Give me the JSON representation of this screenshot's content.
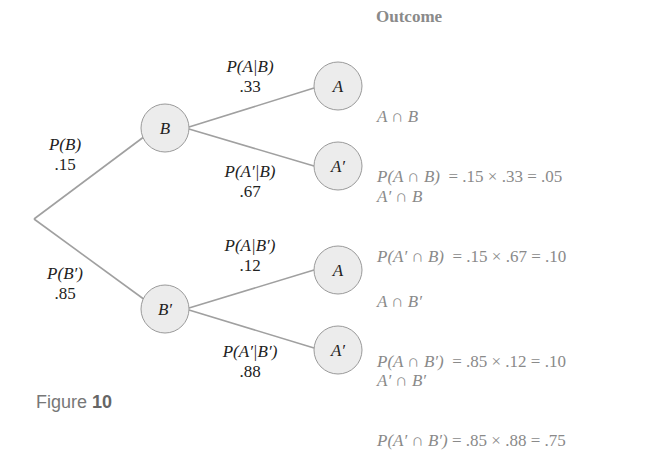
{
  "figure": {
    "label": "Figure",
    "number": "10"
  },
  "header": {
    "outcome": "Outcome"
  },
  "colors": {
    "line": "#a0a0a0",
    "node_fill": "#ececec",
    "node_stroke": "#9a9a9a",
    "label_text": "#222222",
    "outcome_text": "#8a8a8a"
  },
  "nodes": {
    "B": "B",
    "Bp": "B′",
    "A_top": "A",
    "Ap_top": "A′",
    "A_bot": "A",
    "Ap_bot": "A′"
  },
  "branches": {
    "B": {
      "prob_label": "P(B)",
      "value": ".15"
    },
    "Bp": {
      "prob_label": "P(B′)",
      "value": ".85"
    },
    "A_given_B": {
      "prob_label": "P(A|B)",
      "value": ".33"
    },
    "Ap_given_B": {
      "prob_label": "P(A′|B)",
      "value": ".67"
    },
    "A_given_Bp": {
      "prob_label": "P(A|B′)",
      "value": ".12"
    },
    "Ap_given_Bp": {
      "prob_label": "P(A′|B′)",
      "value": ".88"
    }
  },
  "outcomes": [
    {
      "event": "A ∩ B",
      "prob_expr": "P(A ∩ B)",
      "calc": "  = .15 × .33 = .05"
    },
    {
      "event": "A′ ∩ B",
      "prob_expr": "P(A′ ∩ B)",
      "calc": "  = .15 × .67 = .10"
    },
    {
      "event": "A ∩ B′",
      "prob_expr": "P(A ∩ B′)",
      "calc": "  = .85 × .12 = .10"
    },
    {
      "event": "A′ ∩ B′",
      "prob_expr": "P(A′ ∩ B′)",
      "calc": " = .85 × .88 = .75"
    }
  ]
}
